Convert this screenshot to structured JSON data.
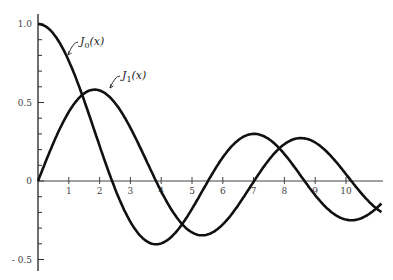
{
  "chart_data": {
    "type": "line",
    "title": "",
    "xlabel": "",
    "ylabel": "",
    "xlim": [
      0,
      11.2
    ],
    "ylim": [
      -0.55,
      1.05
    ],
    "grid": false,
    "legend_position": "inline annotations",
    "x_ticks": [
      "1",
      "2",
      "3",
      "4",
      "5",
      "6",
      "7",
      "8",
      "9",
      "10"
    ],
    "y_ticks": [
      {
        "value": 1.0,
        "label": "1.0"
      },
      {
        "value": 0.5,
        "label": "0.5"
      },
      {
        "value": 0,
        "label": "0"
      },
      {
        "value": -0.5,
        "label": "- 0.5"
      }
    ],
    "series": [
      {
        "name": "J0(x)",
        "label_text": "J",
        "label_sub": "0",
        "label_arg": "(x)",
        "function": "besselJ0",
        "x": [
          0,
          1,
          2,
          2.405,
          3,
          3.832,
          4,
          5,
          5.52,
          6,
          7,
          7.016,
          8,
          8.654,
          9,
          10,
          10.173,
          11
        ],
        "values": [
          1.0,
          0.765,
          0.224,
          0.0,
          -0.26,
          -0.403,
          -0.397,
          -0.178,
          0.0,
          0.151,
          0.3,
          0.3,
          0.172,
          0.0,
          -0.09,
          -0.246,
          -0.25,
          -0.171
        ]
      },
      {
        "name": "J1(x)",
        "label_text": "J",
        "label_sub": "1",
        "label_arg": "(x)",
        "function": "besselJ1",
        "x": [
          0,
          1,
          1.841,
          2,
          3,
          3.832,
          4,
          5,
          5.331,
          6,
          7,
          7.016,
          8,
          8.536,
          9,
          10,
          10.173,
          11
        ],
        "values": [
          0.0,
          0.44,
          0.582,
          0.577,
          0.339,
          0.0,
          -0.066,
          -0.328,
          -0.346,
          -0.277,
          -0.005,
          0.0,
          0.235,
          0.273,
          0.245,
          0.043,
          0.0,
          -0.177
        ]
      }
    ]
  }
}
